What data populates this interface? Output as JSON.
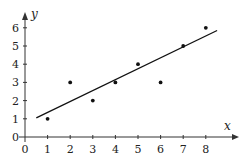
{
  "chart_data": {
    "type": "scatter",
    "title": "",
    "xlabel": "x",
    "ylabel": "y",
    "x_ticks": [
      "0",
      "1",
      "2",
      "3",
      "4",
      "5",
      "6",
      "7",
      "8"
    ],
    "y_ticks": [
      "0",
      "1",
      "2",
      "3",
      "4",
      "5",
      "6"
    ],
    "xlim": [
      0,
      9
    ],
    "ylim": [
      0,
      7
    ],
    "grid": false,
    "legend": null,
    "series": [
      {
        "name": "data points",
        "type": "scatter",
        "x": [
          1,
          2,
          3,
          4,
          5,
          6,
          7,
          8
        ],
        "y": [
          1,
          3,
          2,
          3,
          4,
          3,
          5,
          6
        ]
      },
      {
        "name": "line of best fit",
        "type": "line",
        "x": [
          0.5,
          8.5
        ],
        "y": [
          1.05,
          5.85
        ]
      }
    ]
  }
}
